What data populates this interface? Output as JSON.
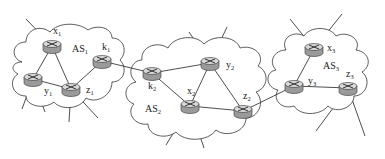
{
  "diagram": {
    "type": "network-topology",
    "autonomous_systems": [
      {
        "id": "AS1",
        "label": "AS",
        "sub": "1",
        "lx": 72,
        "ly": 52
      },
      {
        "id": "AS2",
        "label": "AS",
        "sub": "2",
        "lx": 145,
        "ly": 112
      },
      {
        "id": "AS3",
        "label": "AS",
        "sub": "3",
        "lx": 323,
        "ly": 69
      }
    ],
    "routers": [
      {
        "id": "x1",
        "label": "x",
        "sub": "1",
        "x": 52,
        "y": 46,
        "lx": 53,
        "ly": 34
      },
      {
        "id": "y1",
        "label": "y",
        "sub": "1",
        "x": 33,
        "y": 79,
        "lx": 44,
        "ly": 94
      },
      {
        "id": "z1",
        "label": "z",
        "sub": "1",
        "x": 71,
        "y": 89,
        "lx": 86,
        "ly": 93
      },
      {
        "id": "k1",
        "label": "k",
        "sub": "1",
        "x": 102,
        "y": 61,
        "lx": 102,
        "ly": 50
      },
      {
        "id": "k2",
        "label": "k",
        "sub": "2",
        "x": 152,
        "y": 73,
        "lx": 148,
        "ly": 89
      },
      {
        "id": "x2",
        "label": "x",
        "sub": "2",
        "x": 190,
        "y": 106,
        "lx": 187,
        "ly": 94
      },
      {
        "id": "y2",
        "label": "y",
        "sub": "2",
        "x": 210,
        "y": 63,
        "lx": 226,
        "ly": 68
      },
      {
        "id": "z2",
        "label": "z",
        "sub": "2",
        "x": 243,
        "y": 111,
        "lx": 243,
        "ly": 99
      },
      {
        "id": "x3",
        "label": "x",
        "sub": "3",
        "x": 314,
        "y": 49,
        "lx": 327,
        "ly": 51
      },
      {
        "id": "y3",
        "label": "y",
        "sub": "3",
        "x": 294,
        "y": 86,
        "lx": 308,
        "ly": 84
      },
      {
        "id": "z3",
        "label": "z",
        "sub": "3",
        "x": 348,
        "y": 88,
        "lx": 346,
        "ly": 77
      }
    ],
    "links": [
      [
        "x1",
        "y1"
      ],
      [
        "x1",
        "z1"
      ],
      [
        "y1",
        "z1"
      ],
      [
        "z1",
        "k1"
      ],
      [
        "k1",
        "k2"
      ],
      [
        "k2",
        "y2"
      ],
      [
        "k2",
        "x2"
      ],
      [
        "x2",
        "y2"
      ],
      [
        "y2",
        "z2"
      ],
      [
        "x2",
        "z2"
      ],
      [
        "z2",
        "y3"
      ],
      [
        "y3",
        "x3"
      ],
      [
        "y3",
        "z3"
      ]
    ]
  }
}
